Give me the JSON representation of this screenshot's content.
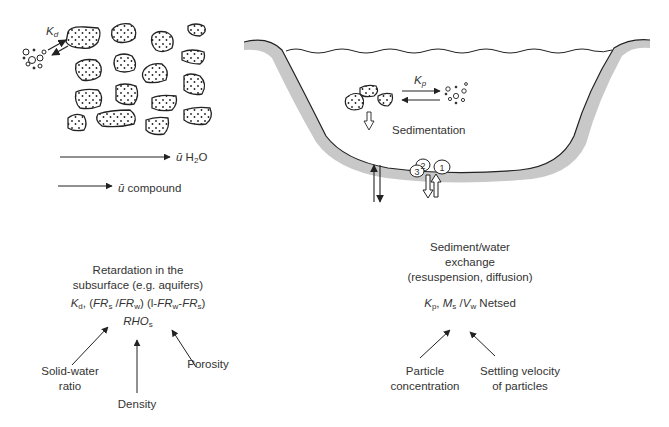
{
  "subsurface": {
    "kd_label": "K",
    "kd_sub": "d",
    "u_h2o_symbol": "ū",
    "u_h2o_text": "H",
    "u_h2o_sub": "2",
    "u_h2o_tail": "O",
    "u_compound_symbol": "ū",
    "u_compound_text": "compound",
    "title_line1": "Retardation in the",
    "title_line2": "subsurface (e.g. aquifers)",
    "formula": {
      "kd": "K",
      "kd_sub": "d",
      "p1": ", (",
      "frs": "FR",
      "frs_sub": "s",
      "slash": " /",
      "frw": "FR",
      "frw_sub": "w",
      "p2": ") (l-",
      "frw2": "FR",
      "frw2_sub": "w",
      "minus": "-",
      "frs2": "FR",
      "frs2_sub": "s",
      "p3": ")",
      "rho": "RHO",
      "rho_sub": "s"
    },
    "labels": {
      "solid_water_line1": "Solid-water",
      "solid_water_line2": "ratio",
      "density": "Density",
      "porosity": "Porosity"
    }
  },
  "surface_water": {
    "kp_label": "K",
    "kp_sub": "p",
    "sedimentation": "Sedimentation",
    "circles": [
      "1",
      "2",
      "3"
    ],
    "title_line1": "Sediment/water",
    "title_line2": "exchange",
    "title_line3": "(resuspension, diffusion)",
    "formula": {
      "kp": "K",
      "kp_sub": "p",
      "sep": ", ",
      "ms": "M",
      "ms_sub": "s",
      "slash": " /",
      "vw": "V",
      "vw_sub": "w",
      "tail": " Netsed"
    },
    "labels": {
      "particle_line1": "Particle",
      "particle_line2": "concentration",
      "settling_line1": "Settling velocity",
      "settling_line2": "of particles"
    }
  },
  "colors": {
    "ink": "#222222",
    "sediment": "#c8c8c8",
    "text": "#333333"
  }
}
